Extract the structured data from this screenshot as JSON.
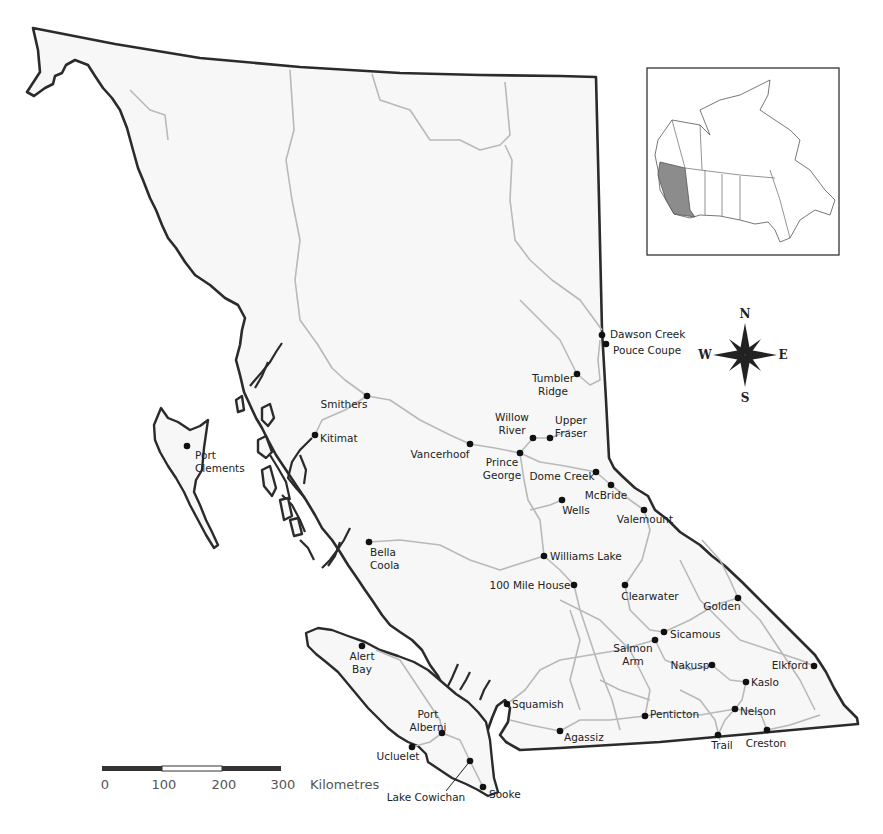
{
  "map": {
    "region": "British Columbia",
    "inset": {
      "label": "Canada",
      "highlighted_province": "British Columbia"
    },
    "compass": {
      "north": "N",
      "south": "S",
      "east": "E",
      "west": "W"
    },
    "scale_bar": {
      "ticks": [
        "0",
        "100",
        "200",
        "300"
      ],
      "unit": "Kilometres"
    },
    "cities": [
      {
        "name": "Dawson Creek",
        "lines": [
          "Dawson Creek"
        ],
        "x": 602,
        "y": 335,
        "lx": 610,
        "ly": 338,
        "anchor": "start"
      },
      {
        "name": "Pouce Coupe",
        "lines": [
          "Pouce Coupe"
        ],
        "x": 606,
        "y": 344,
        "lx": 613,
        "ly": 354,
        "anchor": "start"
      },
      {
        "name": "Tumbler Ridge",
        "lines": [
          "Tumbler",
          "Ridge"
        ],
        "x": 577,
        "y": 374,
        "lx": 553,
        "ly": 382,
        "anchor": "middle"
      },
      {
        "name": "Smithers",
        "lines": [
          "Smithers"
        ],
        "x": 367,
        "y": 396,
        "lx": 344,
        "ly": 408,
        "anchor": "middle"
      },
      {
        "name": "Willow River",
        "lines": [
          "Willow",
          "River"
        ],
        "x": 533,
        "y": 438,
        "lx": 512,
        "ly": 421,
        "anchor": "middle"
      },
      {
        "name": "Upper Fraser",
        "lines": [
          "Upper",
          "Fraser"
        ],
        "x": 550,
        "y": 438,
        "lx": 571,
        "ly": 424,
        "anchor": "middle"
      },
      {
        "name": "Port Clements",
        "lines": [
          "Port",
          "Clements"
        ],
        "x": 187,
        "y": 446,
        "lx": 195,
        "ly": 459,
        "anchor": "start"
      },
      {
        "name": "Kitimat",
        "lines": [
          "Kitimat"
        ],
        "x": 315,
        "y": 435,
        "lx": 320,
        "ly": 442,
        "anchor": "start"
      },
      {
        "name": "Vancerhoof",
        "lines": [
          "Vancerhoof"
        ],
        "x": 470,
        "y": 444,
        "lx": 440,
        "ly": 458,
        "anchor": "middle"
      },
      {
        "name": "Prince George",
        "lines": [
          "Prince",
          "George"
        ],
        "x": 520,
        "y": 453,
        "lx": 502,
        "ly": 466,
        "anchor": "middle"
      },
      {
        "name": "Dome Creek",
        "lines": [
          "Dome Creek"
        ],
        "x": 596,
        "y": 472,
        "lx": 562,
        "ly": 480,
        "anchor": "middle"
      },
      {
        "name": "McBride",
        "lines": [
          "McBride"
        ],
        "x": 611,
        "y": 485,
        "lx": 606,
        "ly": 499,
        "anchor": "middle"
      },
      {
        "name": "Wells",
        "lines": [
          "Wells"
        ],
        "x": 562,
        "y": 500,
        "lx": 576,
        "ly": 514,
        "anchor": "middle"
      },
      {
        "name": "Valemount",
        "lines": [
          "Valemount"
        ],
        "x": 644,
        "y": 510,
        "lx": 645,
        "ly": 523,
        "anchor": "middle"
      },
      {
        "name": "Bella Coola",
        "lines": [
          "Bella",
          "Coola"
        ],
        "x": 369,
        "y": 542,
        "lx": 370,
        "ly": 556,
        "anchor": "start"
      },
      {
        "name": "Williams Lake",
        "lines": [
          "Williams Lake"
        ],
        "x": 544,
        "y": 556,
        "lx": 550,
        "ly": 560,
        "anchor": "start"
      },
      {
        "name": "100 Mile House",
        "lines": [
          "100 Mile House"
        ],
        "x": 574,
        "y": 585,
        "lx": 530,
        "ly": 589,
        "anchor": "middle"
      },
      {
        "name": "Clearwater",
        "lines": [
          "Clearwater"
        ],
        "x": 625,
        "y": 585,
        "lx": 650,
        "ly": 600,
        "anchor": "middle"
      },
      {
        "name": "Golden",
        "lines": [
          "Golden"
        ],
        "x": 738,
        "y": 598,
        "lx": 722,
        "ly": 610,
        "anchor": "middle"
      },
      {
        "name": "Sicamous",
        "lines": [
          "Sicamous"
        ],
        "x": 664,
        "y": 632,
        "lx": 670,
        "ly": 638,
        "anchor": "start"
      },
      {
        "name": "Salmon Arm",
        "lines": [
          "Salmon",
          "Arm"
        ],
        "x": 655,
        "y": 640,
        "lx": 633,
        "ly": 652,
        "anchor": "middle"
      },
      {
        "name": "Nakusp",
        "lines": [
          "Nakusp"
        ],
        "x": 712,
        "y": 665,
        "lx": 690,
        "ly": 669,
        "anchor": "middle"
      },
      {
        "name": "Elkford",
        "lines": [
          "Elkford"
        ],
        "x": 814,
        "y": 666,
        "lx": 790,
        "ly": 669,
        "anchor": "middle"
      },
      {
        "name": "Alert Bay",
        "lines": [
          "Alert",
          "Bay"
        ],
        "x": 362,
        "y": 646,
        "lx": 362,
        "ly": 660,
        "anchor": "middle"
      },
      {
        "name": "Kaslo",
        "lines": [
          "Kaslo"
        ],
        "x": 746,
        "y": 682,
        "lx": 751,
        "ly": 686,
        "anchor": "start"
      },
      {
        "name": "Squamish",
        "lines": [
          "Squamish"
        ],
        "x": 507,
        "y": 704,
        "lx": 512,
        "ly": 708,
        "anchor": "start"
      },
      {
        "name": "Port Alberni",
        "lines": [
          "Port",
          "Alberni"
        ],
        "x": 442,
        "y": 733,
        "lx": 428,
        "ly": 718,
        "anchor": "middle"
      },
      {
        "name": "Nelson",
        "lines": [
          "Nelson"
        ],
        "x": 735,
        "y": 709,
        "lx": 740,
        "ly": 715,
        "anchor": "start"
      },
      {
        "name": "Penticton",
        "lines": [
          "Penticton"
        ],
        "x": 645,
        "y": 716,
        "lx": 650,
        "ly": 718,
        "anchor": "start"
      },
      {
        "name": "Agassiz",
        "lines": [
          "Agassiz"
        ],
        "x": 560,
        "y": 731,
        "lx": 564,
        "ly": 741,
        "anchor": "start"
      },
      {
        "name": "Trail",
        "lines": [
          "Trail"
        ],
        "x": 718,
        "y": 735,
        "lx": 722,
        "ly": 749,
        "anchor": "middle"
      },
      {
        "name": "Creston",
        "lines": [
          "Creston"
        ],
        "x": 767,
        "y": 730,
        "lx": 766,
        "ly": 747,
        "anchor": "middle"
      },
      {
        "name": "Ucluelet",
        "lines": [
          "Ucluelet"
        ],
        "x": 412,
        "y": 747,
        "lx": 398,
        "ly": 760,
        "anchor": "middle"
      },
      {
        "name": "Lake Cowichan",
        "lines": [
          "Lake Cowichan"
        ],
        "x": 470,
        "y": 761,
        "lx": 426,
        "ly": 801,
        "anchor": "middle",
        "leader": true
      },
      {
        "name": "Sooke",
        "lines": [
          "Sooke"
        ],
        "x": 483,
        "y": 787,
        "lx": 489,
        "ly": 798,
        "anchor": "start"
      }
    ]
  }
}
